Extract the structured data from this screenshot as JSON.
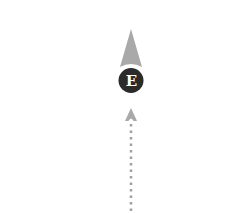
{
  "map": {
    "marker": {
      "label": "E",
      "fill": "#2b2b2b",
      "text_color": "#ffffff"
    },
    "heading_arrow": {
      "color": "#a9a9a9",
      "direction": "north"
    },
    "trail": {
      "style": "dotted",
      "color": "#a0a0a0"
    }
  }
}
